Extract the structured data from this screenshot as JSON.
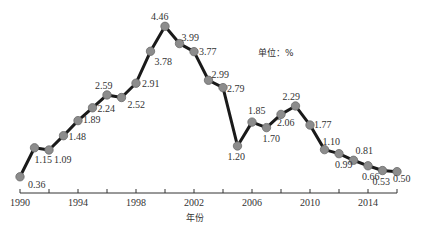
{
  "chart_data": {
    "type": "line",
    "title": "",
    "xlabel": "年份",
    "ylabel": "",
    "unit_label": "单位：%",
    "x": [
      1990,
      1991,
      1992,
      1993,
      1994,
      1995,
      1996,
      1997,
      1998,
      1999,
      2000,
      2001,
      2002,
      2003,
      2004,
      2005,
      2006,
      2007,
      2008,
      2009,
      2010,
      2011,
      2012,
      2013,
      2014,
      2015,
      2016
    ],
    "values": [
      0.36,
      1.15,
      1.09,
      1.48,
      1.89,
      2.24,
      2.59,
      2.52,
      2.91,
      3.78,
      4.46,
      3.99,
      3.77,
      2.99,
      2.79,
      1.2,
      1.85,
      1.7,
      2.06,
      2.29,
      1.77,
      1.1,
      0.99,
      0.81,
      0.66,
      0.53,
      0.5
    ],
    "value_labels": [
      "0.36",
      "1.15",
      "1.09",
      "1.48",
      "1.89",
      "2.24",
      "2.59",
      "2.52",
      "2.91",
      "3.78",
      "4.46",
      "3.99",
      "3.77",
      "2.99",
      "2.79",
      "1.20",
      "1.85",
      "1.70",
      "2.06",
      "2.29",
      "1.77",
      "1.10",
      "0.99",
      "0.81",
      "0.66",
      "0.53",
      "0.50"
    ],
    "x_tick_labels": [
      "1990",
      "1994",
      "1998",
      "2002",
      "2006",
      "2010",
      "2014"
    ],
    "xlim": [
      1990,
      2016
    ],
    "ylim": [
      0,
      5
    ],
    "grid": false,
    "legend": "none",
    "colors": {
      "line": "#1a1a1a",
      "marker_fill": "#8c8c8c",
      "marker_stroke": "#6b6b6b",
      "axis": "#333333"
    }
  },
  "labels": {
    "unit": "单位：%",
    "xlabel": "年份"
  }
}
